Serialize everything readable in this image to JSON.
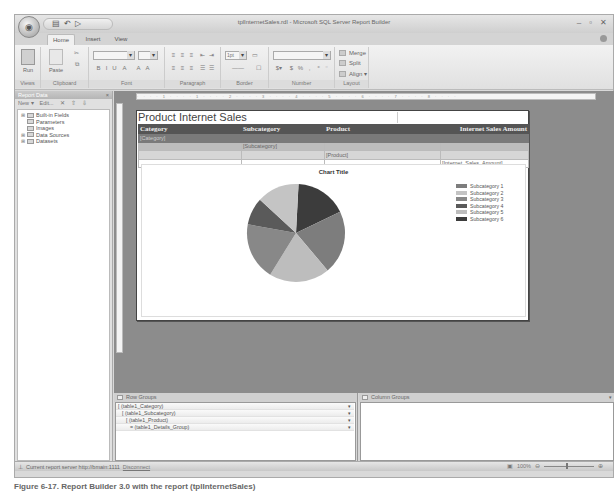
{
  "window": {
    "title": "tplInternetSales.rdl - Microsoft SQL Server Report Builder",
    "controls": [
      "–",
      "▫",
      "✕"
    ]
  },
  "quick_access": {
    "icons": [
      "save-icon",
      "undo-icon",
      "redo-icon"
    ],
    "glyphs": [
      "▤",
      "↶",
      "▷"
    ]
  },
  "tabs": [
    {
      "label": "Home",
      "active": true
    },
    {
      "label": "Insert",
      "active": false
    },
    {
      "label": "View",
      "active": false
    }
  ],
  "ribbon": {
    "groups": {
      "views": "Views",
      "clipboard": "Clipboard",
      "font": "Font",
      "paragraph": "Paragraph",
      "border": "Border",
      "number": "Number",
      "layout": "Layout"
    },
    "run_label": "Run",
    "paste_label": "Paste",
    "border_width": "1pt",
    "layout_items": [
      "Merge",
      "Split",
      "Align ▾"
    ],
    "font_tools": [
      "B",
      "I",
      "U",
      "A",
      "A",
      "A"
    ],
    "paragraph_tools": [
      "≡",
      "≡",
      "≡",
      "⇤",
      "⇥"
    ]
  },
  "report_data": {
    "title": "Report Data",
    "close": "×",
    "toolbar": [
      "New ▾",
      "Edit...",
      "✕",
      "⇧",
      "⇩"
    ],
    "tree": [
      {
        "label": "Built-in Fields",
        "expandable": true
      },
      {
        "label": "Parameters",
        "expandable": false
      },
      {
        "label": "Images",
        "expandable": false
      },
      {
        "label": "Data Sources",
        "expandable": true
      },
      {
        "label": "Datasets",
        "expandable": true
      }
    ]
  },
  "ruler": {
    "marks": "· · · · 1 · · · · 1 · · · · 2 · · · · 3 · · · · 4 · · · · 5 · · · · 6 · · · · 7 · · · · 8 · · · ·"
  },
  "report": {
    "title": "Product Internet Sales",
    "table": {
      "headers": [
        "Category",
        "Subcategory",
        "Product",
        "Internet Sales Amount"
      ],
      "category_row": [
        "[Category]",
        "",
        "",
        ""
      ],
      "subcategory_row": [
        "",
        "[Subcategory]",
        "",
        ""
      ],
      "product_row": [
        "",
        "",
        "[Product]",
        ""
      ],
      "detail_row": [
        "",
        "",
        "",
        "[Internet_Sales_Amount]"
      ]
    }
  },
  "chart_data": {
    "type": "pie",
    "title": "Chart Title",
    "categories": [
      "Subcategory 1",
      "Subcategory 2",
      "Subcategory 3",
      "Subcategory 4",
      "Subcategory 5",
      "Subcategory 6"
    ],
    "legend_labels": [
      "Subcategory 1",
      "Subcategory 2",
      "Subcategory 3",
      "Subcategory 4",
      "Subcategory 5",
      "Subcategory 6"
    ],
    "values": [
      21,
      14,
      19,
      9,
      20,
      17
    ],
    "colors": [
      "#7d7d7d",
      "#c4c4c4",
      "#888888",
      "#5a5a5a",
      "#bdbdbd",
      "#3c3c3c"
    ],
    "legend_position": "right"
  },
  "row_groups": {
    "title": "Row Groups",
    "items": [
      {
        "label": "[ (table1_Category)",
        "indent": 0
      },
      {
        "label": "[ (table1_Subcategory)",
        "indent": 1
      },
      {
        "label": "[ (table1_Product)",
        "indent": 2
      },
      {
        "label": "= (table1_Details_Group)",
        "indent": 3
      }
    ],
    "dropdown": "▾"
  },
  "column_groups": {
    "title": "Column Groups",
    "dropdown": "▾"
  },
  "statusbar": {
    "server_text": "Current report server http://bmain:1111",
    "disconnect": "Disconnect",
    "zoom": "100%",
    "minus": "⊖",
    "plus": "⊕"
  },
  "caption": "Figure 6-17. Report Builder 3.0 with the report (tplInternetSales)"
}
